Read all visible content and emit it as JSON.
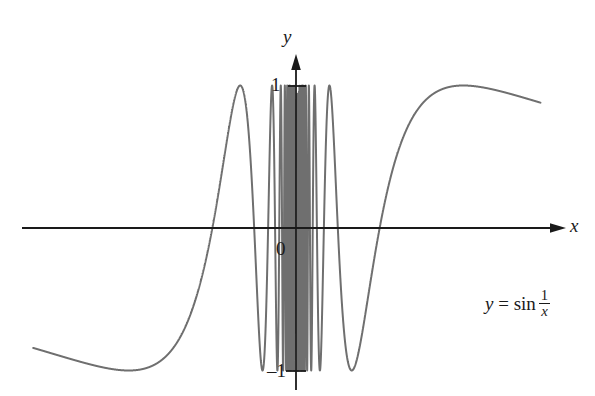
{
  "figure": {
    "name": "graph-of-y-equals-sin-one-over-x",
    "background_color": "#ffffff",
    "width": 595,
    "height": 396
  },
  "axes": {
    "x_label": "x",
    "y_label": "y",
    "origin_label": "0",
    "axis_color": "#1a1a1a",
    "x_axis_pixel_y": 228,
    "y_axis_pixel_x": 296
  },
  "ticks": {
    "y_positive_one": "1",
    "y_negative_one": "–1"
  },
  "equation": {
    "lhs": "y",
    "equals": "=",
    "function": "sin",
    "numerator": "1",
    "denominator": "x",
    "plain_text": "y = sin 1/x"
  },
  "chart_data": {
    "type": "line",
    "title": "",
    "subtitle": "",
    "xlabel": "x",
    "ylabel": "y",
    "legend": [],
    "legend_position": "none",
    "grid": false,
    "annotations": [
      {
        "text": "y = sin 1/x",
        "x": 0.78,
        "y": -0.72
      }
    ],
    "xlim": [
      -1.0,
      0.93
    ],
    "ylim": [
      -1.15,
      1.15
    ],
    "xticks": [],
    "yticks": [
      -1,
      0,
      1
    ],
    "ytick_labels": [
      "–1",
      "0",
      "1"
    ],
    "curve_color": "#6f6f6f",
    "curve_width": 2.0,
    "series": [
      {
        "name": "y = sin(1/x)",
        "formula": "sin(1/x)",
        "domain_left": [
          -1.0,
          -0.0045
        ],
        "domain_right": [
          0.0045,
          0.93
        ],
        "sample_count": 6000,
        "description": "Oscillations of sin(1/x): amplitude is constant at 1 while the frequency grows without bound as x approaches 0 from both sides, producing an infinitely dense band of vertical-looking strokes near the y-axis and broad smooth waves near the left and right edges.",
        "zeros_near_edges": [
          -0.3183,
          -0.1061,
          -0.0637,
          0.0637,
          0.1061,
          0.3183
        ],
        "maxima_near_edges": [
          -0.6366,
          -0.1273,
          0.1273,
          0.6366
        ],
        "minima_near_edges": [
          -0.2122,
          -0.0909,
          0.0909,
          0.2122
        ]
      }
    ]
  }
}
